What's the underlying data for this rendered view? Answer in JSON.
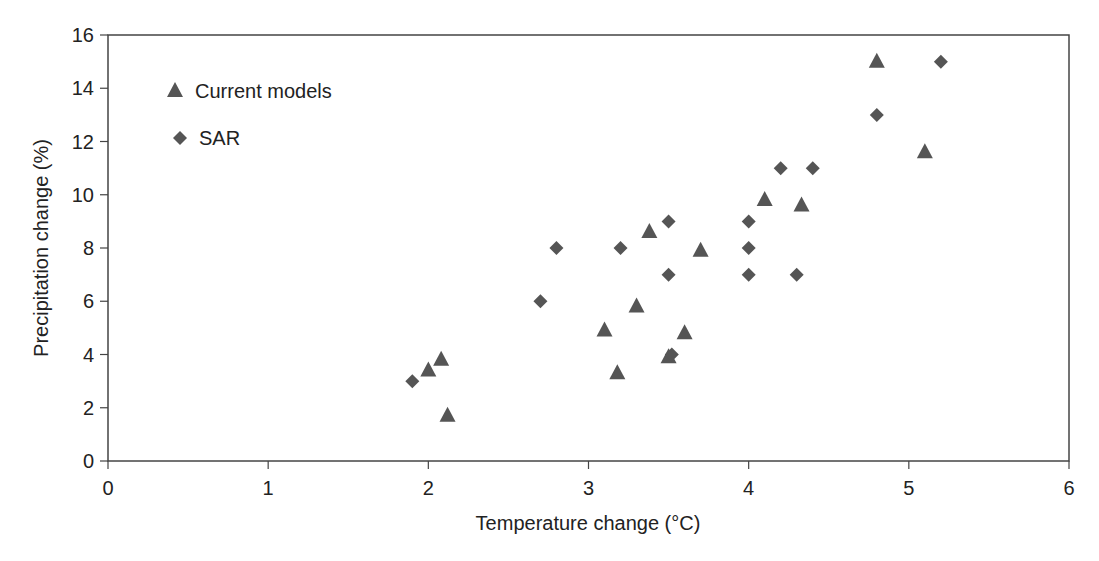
{
  "chart_data": {
    "type": "scatter",
    "title": "",
    "xlabel": "Temperature change (°C)",
    "ylabel": "Precipitation change (%)",
    "xlim": [
      0,
      6
    ],
    "ylim": [
      0,
      16
    ],
    "xticks": [
      0,
      1,
      2,
      3,
      4,
      5,
      6
    ],
    "yticks": [
      0,
      2,
      4,
      6,
      8,
      10,
      12,
      14,
      16
    ],
    "grid": false,
    "legend_position": "upper-left-inside",
    "series": [
      {
        "name": "Current models",
        "marker": "triangle",
        "color": "#555555",
        "points": [
          [
            2.0,
            3.4
          ],
          [
            2.08,
            3.8
          ],
          [
            2.12,
            1.7
          ],
          [
            3.1,
            4.9
          ],
          [
            3.18,
            3.3
          ],
          [
            3.3,
            5.8
          ],
          [
            3.38,
            8.6
          ],
          [
            3.5,
            3.9
          ],
          [
            3.6,
            4.8
          ],
          [
            3.7,
            7.9
          ],
          [
            4.1,
            9.8
          ],
          [
            4.33,
            9.6
          ],
          [
            4.8,
            15.0
          ],
          [
            5.1,
            11.6
          ]
        ]
      },
      {
        "name": "SAR",
        "marker": "diamond",
        "color": "#555555",
        "points": [
          [
            1.9,
            3.0
          ],
          [
            2.7,
            6.0
          ],
          [
            2.8,
            8.0
          ],
          [
            3.2,
            8.0
          ],
          [
            3.5,
            9.0
          ],
          [
            3.5,
            7.0
          ],
          [
            3.52,
            4.0
          ],
          [
            4.0,
            9.0
          ],
          [
            4.0,
            8.0
          ],
          [
            4.0,
            7.0
          ],
          [
            4.2,
            11.0
          ],
          [
            4.3,
            7.0
          ],
          [
            4.4,
            11.0
          ],
          [
            4.8,
            13.0
          ],
          [
            5.2,
            15.0
          ]
        ]
      }
    ]
  },
  "legend": {
    "items": [
      {
        "label": "Current models",
        "marker": "triangle"
      },
      {
        "label": "SAR",
        "marker": "diamond"
      }
    ]
  },
  "colors": {
    "axis": "#444444",
    "marker": "#555555"
  }
}
